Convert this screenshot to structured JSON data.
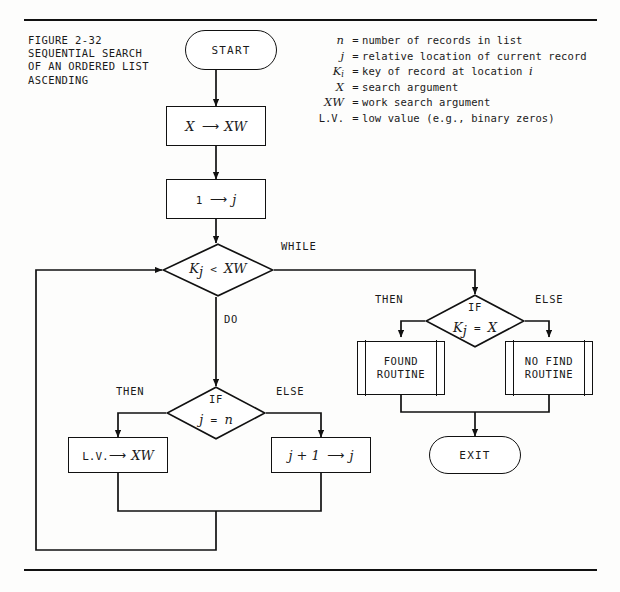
{
  "figure": {
    "caption": "FIGURE 2-32\nSEQUENTIAL SEARCH\nOF AN ORDERED LIST\nASCENDING"
  },
  "legend": {
    "items": [
      {
        "symbol": "n",
        "symbol_style": "italic",
        "eq": "=",
        "description": "number of records in list"
      },
      {
        "symbol": "j",
        "symbol_style": "italic",
        "eq": "=",
        "description": "relative location of current record"
      },
      {
        "symbol": "K",
        "symbol_sub": "i",
        "symbol_style": "italic",
        "eq": "=",
        "description": "key of record at location i"
      },
      {
        "symbol": "X",
        "symbol_style": "italic",
        "eq": "=",
        "description": "search argument"
      },
      {
        "symbol": "XW",
        "symbol_style": "italic",
        "eq": "=",
        "description": "work search argument"
      },
      {
        "symbol": "L.V.",
        "symbol_style": "plain",
        "eq": "=",
        "description": "low value (e.g., binary zeros)"
      }
    ]
  },
  "flowchart": {
    "nodes": {
      "start": {
        "label": "START",
        "type": "terminal"
      },
      "set_xw": {
        "lhs": "X",
        "arrow": "⟶",
        "rhs": "XW",
        "type": "process"
      },
      "set_j": {
        "lhs": "1",
        "arrow": "⟶",
        "rhs": "j",
        "type": "process"
      },
      "while_test": {
        "lhs": "K",
        "lhs_sub": "j",
        "op": "<",
        "rhs": "XW",
        "type": "decision"
      },
      "inner_if": {
        "lhs": "j",
        "op": "=",
        "rhs": "n",
        "type": "decision"
      },
      "lv_to_xw": {
        "lhs": "L.V.",
        "arrow": "⟶",
        "rhs": "XW",
        "type": "process"
      },
      "incr_j": {
        "lhs": "j + 1",
        "arrow": "⟶",
        "rhs": "j",
        "type": "process"
      },
      "found_if": {
        "lhs": "K",
        "lhs_sub": "j",
        "op": "=",
        "rhs": "X",
        "type": "decision"
      },
      "found_rtn": {
        "label": "FOUND\nROUTINE",
        "line1": "FOUND",
        "line2": "ROUTINE",
        "type": "predefined-process"
      },
      "nofind_rtn": {
        "label": "NO FIND\nROUTINE",
        "line1": "NO FIND",
        "line2": "ROUTINE",
        "type": "predefined-process"
      },
      "exit": {
        "label": "EXIT",
        "type": "terminal"
      }
    },
    "labels": {
      "while": "WHILE",
      "do": "DO",
      "if_top": "IF",
      "if_inner": "IF",
      "then_inner": "THEN",
      "else_inner": "ELSE",
      "then_found": "THEN",
      "else_found": "ELSE"
    }
  },
  "colors": {
    "ink": "#111111",
    "paper": "#fdfdfc"
  }
}
